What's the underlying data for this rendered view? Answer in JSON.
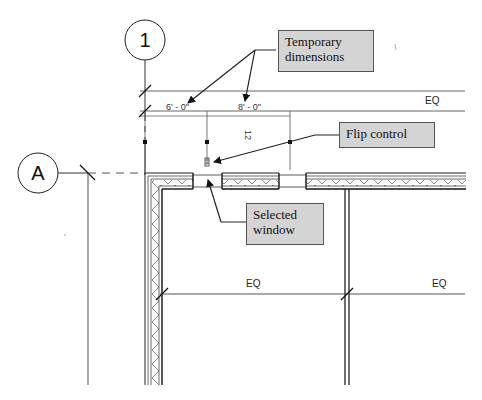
{
  "drawing": {
    "type": "architectural floor plan detail",
    "grid_lines": {
      "vertical": {
        "label": "1"
      },
      "horizontal": {
        "label": "A"
      }
    },
    "dimensions": {
      "temporary": [
        "6' - 0\"",
        "8' - 0\""
      ],
      "rotated_value": "12",
      "equality_labels": [
        "EQ",
        "EQ",
        "EQ"
      ]
    },
    "callouts": {
      "temporary_dimensions": {
        "line1": "Temporary",
        "line2": "dimensions"
      },
      "flip_control": {
        "text": "Flip control"
      },
      "selected_window": {
        "line1": "Selected",
        "line2": "window"
      }
    },
    "colors": {
      "callout_fill": "#d4d4d4",
      "callout_border": "#555555",
      "line": "#222222",
      "dim_line": "#666666"
    }
  }
}
